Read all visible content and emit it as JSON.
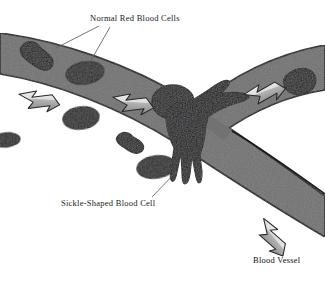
{
  "figure": {
    "labels": {
      "normal_cells": "Normal Red Blood Cells",
      "sickle_cell": "Sickle-Shaped Blood Cell",
      "blood_vessel": "Blood Vessel"
    },
    "colors": {
      "background": "#ffffff",
      "vessel_fill": "#727272",
      "vessel_outline": "#1b1b1b",
      "cell_fill": "#201f22",
      "cell_outline": "#000000",
      "sickle_fill": "#17161a",
      "arrow_light": "#e8e8e8",
      "arrow_shade": "#9a9a9a",
      "arrow_outline": "#2a2a2a",
      "leader_line": "#5d5d5d",
      "text": "#1a1a1a"
    },
    "icons": {
      "flow_arrow": "flow-arrow-icon",
      "red_blood_cell": "red-blood-cell-icon",
      "sickle_cell": "sickle-cell-icon"
    },
    "counts": {
      "normal_cells": 8,
      "sickle_cells": 1,
      "flow_arrows": 4,
      "vessel_branches": 2
    }
  }
}
